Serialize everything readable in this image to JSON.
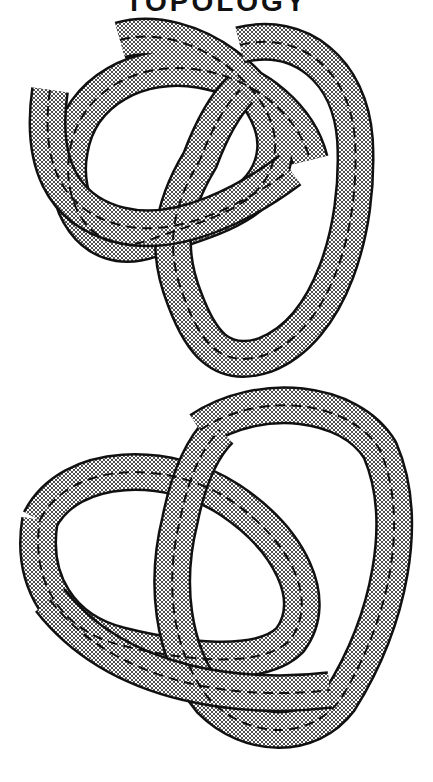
{
  "header": {
    "title": "TOPOLOGY"
  },
  "figures": [
    {
      "name": "trefoil-knot-ribbon-upper",
      "style": "crosshatched ribbon with dashed centerline"
    },
    {
      "name": "trefoil-knot-ribbon-lower",
      "style": "crosshatched ribbon with dashed centerline"
    }
  ],
  "colors": {
    "ink": "#111111",
    "paper": "#ffffff"
  }
}
